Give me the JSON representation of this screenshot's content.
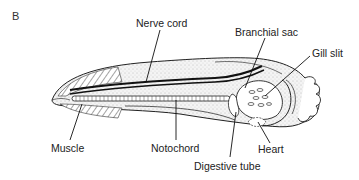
{
  "figure": {
    "panel_label": "B",
    "labels": {
      "nerve_cord": "Nerve cord",
      "branchial_sac": "Branchial sac",
      "gill_slit": "Gill slit",
      "muscle": "Muscle",
      "notochord": "Notochord",
      "heart": "Heart",
      "digestive_tube": "Digestive tube"
    }
  }
}
